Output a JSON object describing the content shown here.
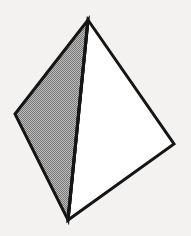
{
  "figure": {
    "canvas": {
      "width": 191,
      "height": 236,
      "background_color": "#f4f2f0"
    },
    "style": {
      "edge_color": "#151515",
      "edge_width": 3,
      "shaded_face_color": "#9a9a9a",
      "shaded_face_pattern": "50-percent-dither",
      "lit_face_color": "#ffffff"
    },
    "vertices": [
      {
        "name": "apex",
        "x": 88,
        "y": 20
      },
      {
        "name": "left",
        "x": 15,
        "y": 114
      },
      {
        "name": "right",
        "x": 174,
        "y": 144
      },
      {
        "name": "bottom",
        "x": 68,
        "y": 220
      }
    ],
    "faces": [
      {
        "name": "left-shaded-face",
        "points": "88,20 15,114 68,220",
        "fill": "#9a9a9a",
        "shading": "dithered"
      },
      {
        "name": "right-lit-face",
        "points": "88,20 174,144 68,220",
        "fill": "#ffffff",
        "shading": "flat"
      }
    ],
    "edges": [
      {
        "name": "edge-apex-left",
        "x1": 88,
        "y1": 20,
        "x2": 15,
        "y2": 114
      },
      {
        "name": "edge-left-bottom",
        "x1": 15,
        "y1": 114,
        "x2": 68,
        "y2": 220
      },
      {
        "name": "edge-apex-bottom",
        "x1": 88,
        "y1": 20,
        "x2": 68,
        "y2": 220
      },
      {
        "name": "edge-apex-right",
        "x1": 88,
        "y1": 20,
        "x2": 174,
        "y2": 144
      },
      {
        "name": "edge-right-bottom",
        "x1": 174,
        "y1": 144,
        "x2": 68,
        "y2": 220
      }
    ]
  }
}
